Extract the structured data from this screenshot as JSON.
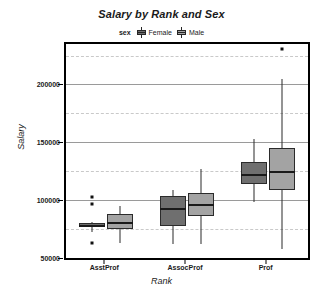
{
  "chart_data": {
    "type": "box",
    "title": "Salary by Rank and Sex",
    "xlabel": "Rank",
    "ylabel": "Salary",
    "categories": [
      "AsstProf",
      "AssocProf",
      "Prof"
    ],
    "ylim": [
      50000,
      235000
    ],
    "yticks": [
      50000,
      100000,
      150000,
      200000
    ],
    "ytick_labels": [
      "50000",
      "100000",
      "150000",
      "200000"
    ],
    "minor_gridlines": [
      75000,
      125000,
      175000,
      225000
    ],
    "grid": true,
    "legend": {
      "title": "sex",
      "position": "top",
      "entries": [
        {
          "name": "Female",
          "color": "#6f6f6f"
        },
        {
          "name": "Male",
          "color": "#a3a3a3"
        }
      ]
    },
    "series": [
      {
        "name": "Female",
        "color": "#6f6f6f",
        "boxes": [
          {
            "category": "AsstProf",
            "min": 72500,
            "q1": 77000,
            "median": 78000,
            "q3": 80000,
            "max": 81000,
            "outliers": [
              103000,
              97000,
              63000
            ]
          },
          {
            "category": "AssocProf",
            "min": 62000,
            "q1": 77500,
            "median": 92500,
            "q3": 104000,
            "max": 109000,
            "outliers": []
          },
          {
            "category": "Prof",
            "min": 98000,
            "q1": 114000,
            "median": 122000,
            "q3": 133000,
            "max": 153000,
            "outliers": []
          }
        ]
      },
      {
        "name": "Male",
        "color": "#a3a3a3",
        "boxes": [
          {
            "category": "AsstProf",
            "min": 63000,
            "q1": 75000,
            "median": 80000,
            "q3": 88000,
            "max": 95000,
            "outliers": []
          },
          {
            "category": "AssocProf",
            "min": 62000,
            "q1": 86000,
            "median": 96000,
            "q3": 106000,
            "max": 127000,
            "outliers": []
          },
          {
            "category": "Prof",
            "min": 58000,
            "q1": 109000,
            "median": 124000,
            "q3": 145000,
            "max": 205000,
            "outliers": [
              231000
            ]
          }
        ]
      }
    ]
  }
}
